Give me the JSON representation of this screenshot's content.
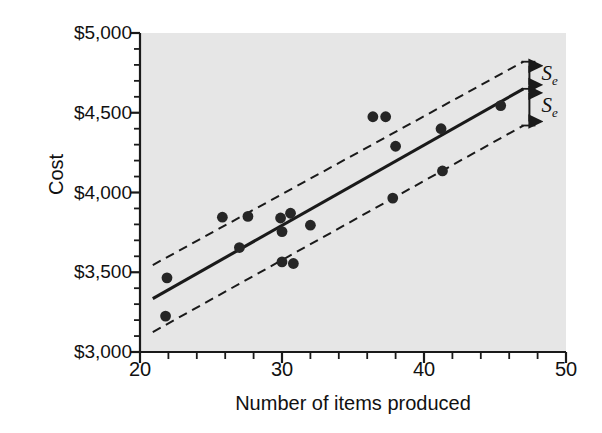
{
  "chart_data": {
    "type": "scatter",
    "title": "",
    "xlabel": "Number of items produced",
    "ylabel": "Cost",
    "xlim": [
      20,
      50
    ],
    "ylim": [
      3000,
      5000
    ],
    "grid": false,
    "legend": null,
    "x_ticks": [
      20,
      30,
      40,
      50
    ],
    "x_tick_labels": [
      "20",
      "30",
      "40",
      "50"
    ],
    "x_minor_step": 2,
    "y_ticks": [
      3000,
      3500,
      4000,
      4500,
      5000
    ],
    "y_tick_labels": [
      "$3,000",
      "$3,500",
      "$4,000",
      "$4,500",
      "$5,000"
    ],
    "y_minor_step": 100,
    "points": [
      {
        "x": 21.8,
        "y": 3225
      },
      {
        "x": 21.9,
        "y": 3465
      },
      {
        "x": 25.8,
        "y": 3845
      },
      {
        "x": 27.0,
        "y": 3655
      },
      {
        "x": 27.6,
        "y": 3850
      },
      {
        "x": 29.9,
        "y": 3840
      },
      {
        "x": 30.0,
        "y": 3755
      },
      {
        "x": 30.0,
        "y": 3565
      },
      {
        "x": 30.6,
        "y": 3870
      },
      {
        "x": 30.8,
        "y": 3555
      },
      {
        "x": 32.0,
        "y": 3795
      },
      {
        "x": 36.4,
        "y": 4475
      },
      {
        "x": 37.3,
        "y": 4475
      },
      {
        "x": 37.8,
        "y": 3965
      },
      {
        "x": 38.0,
        "y": 4290
      },
      {
        "x": 41.2,
        "y": 4400
      },
      {
        "x": 41.3,
        "y": 4135
      },
      {
        "x": 45.4,
        "y": 4545
      }
    ],
    "regression_line": {
      "style": "solid",
      "x1": 20.9,
      "y1": 3335,
      "x2": 47.0,
      "y2": 4650
    },
    "upper_band": {
      "style": "dashed",
      "x1": 20.9,
      "y1": 3545,
      "x2": 47.0,
      "y2": 4820
    },
    "lower_band": {
      "style": "dashed",
      "x1": 20.9,
      "y1": 3125,
      "x2": 47.0,
      "y2": 4420
    },
    "annotations": [
      {
        "name": "se-upper",
        "text": "S",
        "sub": "e",
        "meaning": "standard error of estimate above regression line"
      },
      {
        "name": "se-lower",
        "text": "S",
        "sub": "e",
        "meaning": "standard error of estimate below regression line"
      }
    ]
  },
  "colors": {
    "plot_background": "#e6e6e6",
    "axis": "#1a1a1a",
    "point": "#262626",
    "line": "#1a1a1a",
    "text": "#111111",
    "page_background": "#ffffff"
  }
}
